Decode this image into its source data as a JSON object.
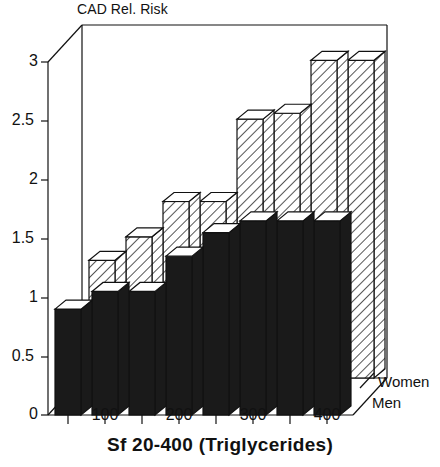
{
  "chart_data": {
    "type": "bar",
    "title": "CAD Rel. Risk",
    "xlabel": "Sf 20-400 (Triglycerides)",
    "ylabel": "CAD Rel. Risk",
    "style": "3d-grouped-bar",
    "grid": false,
    "legend_position": "right-floor",
    "ylim": [
      0,
      3
    ],
    "yticks": [
      "0",
      "0.5",
      "1",
      "1.5",
      "2",
      "2.5",
      "3"
    ],
    "ytick_values": [
      0,
      0.5,
      1,
      1.5,
      2,
      2.5,
      3
    ],
    "categories": [
      "",
      "100",
      "",
      "200",
      "",
      "300",
      "",
      "400"
    ],
    "xtick_labels": [
      "100",
      "200",
      "300",
      "400"
    ],
    "n_bars": 8,
    "series": [
      {
        "name": "Men",
        "fill": "solid-black",
        "color": "#1a1a1a",
        "values": [
          0.9,
          1.05,
          1.05,
          1.35,
          1.55,
          1.65,
          1.65,
          1.65
        ]
      },
      {
        "name": "Women",
        "fill": "diagonal-hatch",
        "color": "#ffffff",
        "values": [
          1.0,
          1.2,
          1.5,
          1.5,
          2.2,
          2.25,
          2.7,
          2.7
        ]
      }
    ]
  },
  "axes": {
    "y_tick_labels": [
      "3",
      "2.5",
      "2",
      "1.5",
      "1",
      "0.5",
      "0"
    ],
    "x_tick_labels": [
      "100",
      "200",
      "300",
      "400"
    ],
    "x_title": "Sf 20-400 (Triglycerides)",
    "y_title": "CAD Rel. Risk"
  },
  "legend": {
    "women_label": "Women",
    "men_label": "Men"
  },
  "colors": {
    "bar_men": "#1a1a1a",
    "bar_women_fill": "#ffffff",
    "hatch_stroke": "#2a2a2a",
    "outline": "#111111",
    "background": "#ffffff"
  }
}
